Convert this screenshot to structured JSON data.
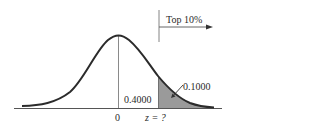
{
  "diagram": {
    "type": "normal-distribution-curve",
    "annotation_arrow_label": "Top 10%",
    "left_area_label": "0.4000",
    "right_tail_label": "0.1000",
    "mean_tick_label": "0",
    "z_label": "z = ?",
    "colors": {
      "curve": "#2b2b2b",
      "shaded_tail": "#9a9a9a",
      "axis": "#555555",
      "mean_line": "#8a8a8a",
      "text": "#2a2a2a"
    }
  }
}
